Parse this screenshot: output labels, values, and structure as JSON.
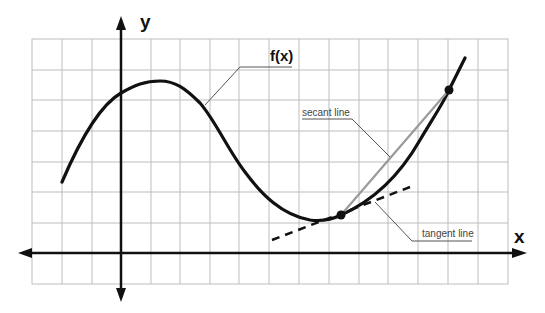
{
  "diagram": {
    "axes": {
      "x_label": "x",
      "y_label": "y"
    },
    "curve": {
      "label": "f(x)",
      "color": "#111111"
    },
    "secant": {
      "label": "secant line",
      "color": "#999999"
    },
    "tangent": {
      "label": "tangent line",
      "style": "dashed",
      "color": "#111111"
    },
    "grid": {
      "columns": 16,
      "rows": 8,
      "color": "#bbbbbb"
    },
    "points": [
      {
        "name": "tangent-point",
        "role": "point of tangency / secant start"
      },
      {
        "name": "secant-point",
        "role": "secant end"
      }
    ]
  }
}
